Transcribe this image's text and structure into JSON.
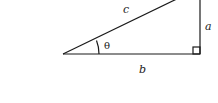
{
  "diagram": {
    "title": "",
    "type": "right-triangle",
    "labels": {
      "hypotenuse": "c",
      "opposite": "a",
      "adjacent": "b",
      "angle": "θ"
    },
    "colors": {
      "stroke": "#1a1a1a",
      "background": "#ffffff"
    },
    "right_angle_marker": true
  }
}
